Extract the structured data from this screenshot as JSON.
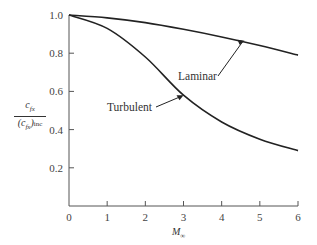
{
  "chart_data": {
    "type": "line",
    "title": "",
    "xlabel": "M∞",
    "ylabel": "c_fx / (c_fx)_inc",
    "xlim": [
      0,
      6
    ],
    "ylim": [
      0,
      1.0
    ],
    "grid": false,
    "legend": "none (inline annotations)",
    "xticks": [
      "0",
      "1",
      "2",
      "3",
      "4",
      "5",
      "6"
    ],
    "yticks": [
      "0.2",
      "0.4",
      "0.6",
      "0.8",
      "1.0"
    ],
    "x": [
      0,
      1,
      2,
      3,
      4,
      5,
      6
    ],
    "series": [
      {
        "name": "Laminar",
        "values": [
          1.0,
          0.985,
          0.96,
          0.925,
          0.885,
          0.84,
          0.79
        ]
      },
      {
        "name": "Turbulent",
        "values": [
          1.0,
          0.93,
          0.78,
          0.58,
          0.44,
          0.35,
          0.29
        ]
      }
    ],
    "annotations": [
      {
        "text": "Laminar",
        "points_to": {
          "x": 4.6,
          "y": 0.865
        }
      },
      {
        "text": "Turbulent",
        "points_to": {
          "x": 3.0,
          "y": 0.58
        }
      }
    ]
  },
  "labels": {
    "y_num": "c",
    "y_num_sub": "fx",
    "y_den_open": "(c",
    "y_den_sub": "fx",
    "y_den_close": ")",
    "y_den_inc": "inc",
    "x_main": "M",
    "x_sub": "∞",
    "laminar": "Laminar",
    "turbulent": "Turbulent"
  }
}
